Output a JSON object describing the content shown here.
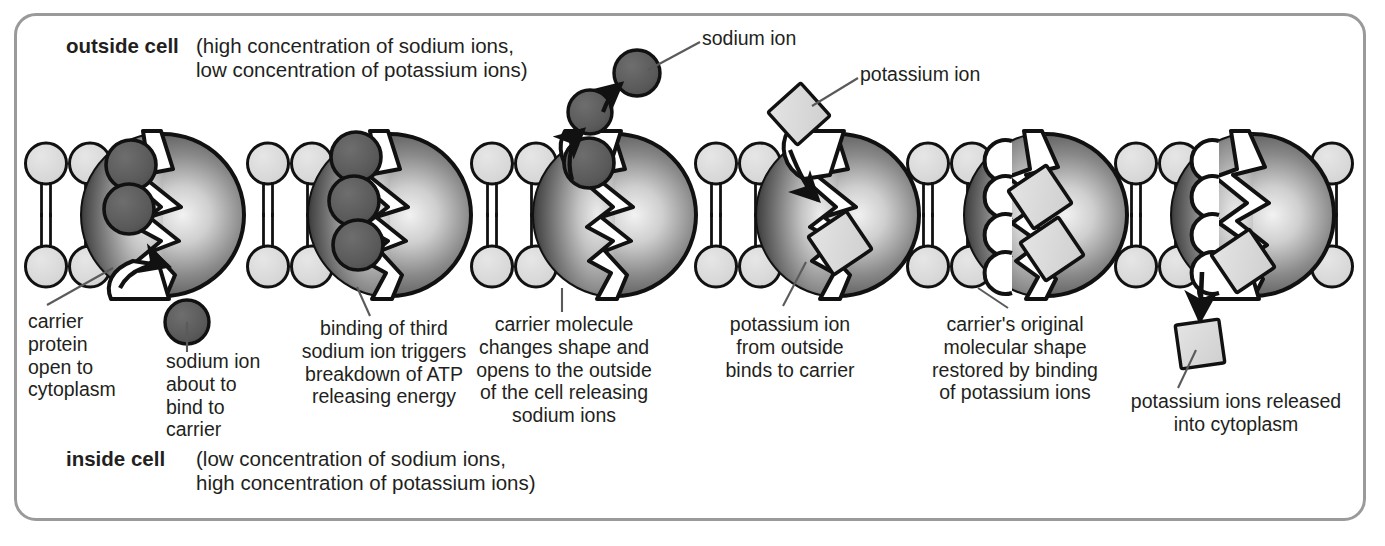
{
  "figure": {
    "border_color": "#9a9a9a",
    "background": "#ffffff"
  },
  "colors": {
    "sodium_ion_fill": "#595959",
    "potassium_ion_fill": "#d8d8d8",
    "phospholipid_head_fill": "#d9d9d9",
    "carrier_dark": "#4d4d4d",
    "carrier_light": "#e8e8e8",
    "outline": "#111111",
    "text": "#231f20"
  },
  "region_labels": {
    "outside": {
      "name": "outside cell",
      "detail_line1": "(high concentration of sodium ions,",
      "detail_line2": "low concentration of potassium ions)"
    },
    "inside": {
      "name": "inside cell",
      "detail_line1": "(low concentration of sodium ions,",
      "detail_line2": "high concentration of potassium ions)"
    }
  },
  "key_callouts": [
    {
      "id": "sodium-ion-callout",
      "label": "sodium ion",
      "icon": "sodium-ion-circle"
    },
    {
      "id": "potassium-ion-callout",
      "label": "potassium ion",
      "icon": "potassium-ion-square"
    }
  ],
  "stages": [
    {
      "id": "stage-1",
      "number": 1,
      "caption_lines": [
        "carrier",
        "protein",
        "open to",
        "cytoplasm"
      ],
      "secondary_caption_lines": [
        "sodium ion",
        "about to",
        "bind to",
        "carrier"
      ],
      "sodium_ions_bound": 2,
      "potassium_ions_bound": 0,
      "channel_shape": "jagged-open-down"
    },
    {
      "id": "stage-2",
      "number": 2,
      "caption_lines": [
        "binding of third",
        "sodium ion triggers",
        "breakdown of ATP",
        "releasing energy"
      ],
      "secondary_caption_lines": [],
      "sodium_ions_bound": 3,
      "potassium_ions_bound": 0,
      "channel_shape": "jagged-closed"
    },
    {
      "id": "stage-3",
      "number": 3,
      "caption_lines": [
        "carrier molecule",
        "changes shape and",
        "opens to the outside",
        "of the cell releasing",
        "sodium ions"
      ],
      "secondary_caption_lines": [],
      "sodium_ions_bound": 1,
      "potassium_ions_bound": 0,
      "channel_shape": "jagged-open-up"
    },
    {
      "id": "stage-4",
      "number": 4,
      "caption_lines": [
        "potassium ion",
        "from outside",
        "binds to carrier"
      ],
      "secondary_caption_lines": [],
      "sodium_ions_bound": 0,
      "potassium_ions_bound": 1,
      "channel_shape": "jagged-open-up"
    },
    {
      "id": "stage-5",
      "number": 5,
      "caption_lines": [
        "carrier's original",
        "molecular shape",
        "restored by binding",
        "of potassium ions"
      ],
      "secondary_caption_lines": [],
      "sodium_ions_bound": 0,
      "potassium_ions_bound": 2,
      "channel_shape": "scalloped-closed"
    },
    {
      "id": "stage-6",
      "number": 6,
      "caption_lines": [
        "potassium ions released",
        "into cytoplasm"
      ],
      "secondary_caption_lines": [],
      "sodium_ions_bound": 0,
      "potassium_ions_bound": 1,
      "channel_shape": "scalloped-open-down"
    }
  ],
  "chart_data": {
    "type": "diagram",
    "stage_count": 6,
    "ion_legend": [
      "sodium ion",
      "potassium ion"
    ],
    "membrane": "phospholipid bilayer"
  }
}
